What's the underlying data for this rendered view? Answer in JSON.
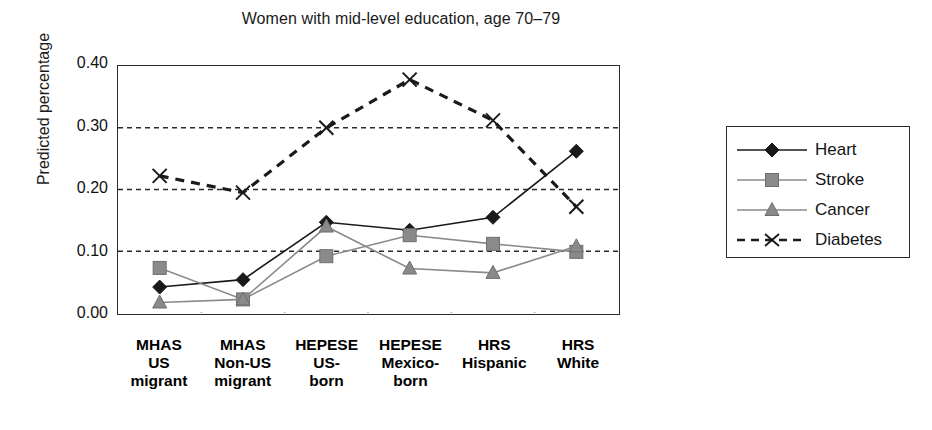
{
  "chart_data": {
    "type": "line",
    "title": "Women with mid-level education, age 70–79",
    "xlabel": "",
    "ylabel": "Predicted percentage",
    "categories": [
      "MHAS US migrant",
      "MHAS Non-US migrant",
      "HEPESE US-born",
      "HEPESE Mexico-born",
      "HRS Hispanic",
      "HRS White"
    ],
    "category_lines": [
      [
        "MHAS",
        "US",
        "migrant"
      ],
      [
        "MHAS",
        "Non-US",
        "migrant"
      ],
      [
        "HEPESE",
        "US-",
        "born"
      ],
      [
        "HEPESE",
        "Mexico-",
        "born"
      ],
      [
        "HRS",
        "Hispanic"
      ],
      [
        "HRS",
        "White"
      ]
    ],
    "ylim": [
      0.0,
      0.4
    ],
    "yticks": [
      0.0,
      0.1,
      0.2,
      0.3,
      0.4
    ],
    "ytick_labels": [
      "0.00",
      "0.10",
      "0.20",
      "0.30",
      "0.40"
    ],
    "grid": "horizontal-dashed",
    "legend_position": "right",
    "series": [
      {
        "name": "Heart",
        "marker": "diamond",
        "line": "solid",
        "color": "#1a1a1a",
        "values": [
          0.042,
          0.054,
          0.147,
          0.134,
          0.155,
          0.262
        ]
      },
      {
        "name": "Stroke",
        "marker": "square",
        "line": "solid",
        "color": "#8a8a8a",
        "values": [
          0.073,
          0.022,
          0.092,
          0.126,
          0.112,
          0.099
        ]
      },
      {
        "name": "Cancer",
        "marker": "triangle",
        "line": "solid",
        "color": "#8a8a8a",
        "values": [
          0.017,
          0.022,
          0.14,
          0.072,
          0.065,
          0.108
        ]
      },
      {
        "name": "Diabetes",
        "marker": "x",
        "line": "dashed",
        "color": "#1a1a1a",
        "values": [
          0.222,
          0.195,
          0.3,
          0.378,
          0.312,
          0.172
        ]
      }
    ]
  }
}
